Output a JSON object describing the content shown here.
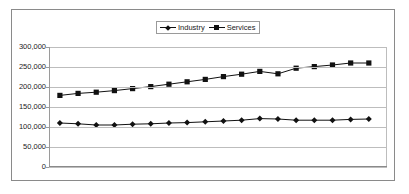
{
  "chart_data": {
    "type": "line",
    "title": "",
    "xlabel": "",
    "ylabel": "",
    "ylim": [
      0,
      300000
    ],
    "yticks": [
      0,
      50000,
      100000,
      150000,
      200000,
      250000,
      300000
    ],
    "ytick_labels": [
      "0",
      "50,000",
      "100,000",
      "150,000",
      "200,000",
      "250,000",
      "300,000"
    ],
    "grid": true,
    "legend_position": "top-center",
    "x": [
      1,
      2,
      3,
      4,
      5,
      6,
      7,
      8,
      9,
      10,
      11,
      12,
      13,
      14,
      15,
      16,
      17,
      18
    ],
    "series": [
      {
        "name": "Industry",
        "marker": "diamond",
        "color": "#111111",
        "values": [
          110000,
          108000,
          105000,
          105000,
          107000,
          108000,
          110000,
          111000,
          113000,
          115000,
          117000,
          121000,
          120000,
          117000,
          117000,
          117000,
          119000,
          120000
        ]
      },
      {
        "name": "Services",
        "marker": "square",
        "color": "#111111",
        "values": [
          179000,
          184000,
          187000,
          191000,
          196000,
          201000,
          207000,
          213000,
          219000,
          226000,
          232000,
          239000,
          233000,
          247000,
          251000,
          255000,
          260000,
          260000
        ]
      }
    ]
  },
  "legend": {
    "entries": [
      {
        "label": "Industry"
      },
      {
        "label": "Services"
      }
    ]
  }
}
